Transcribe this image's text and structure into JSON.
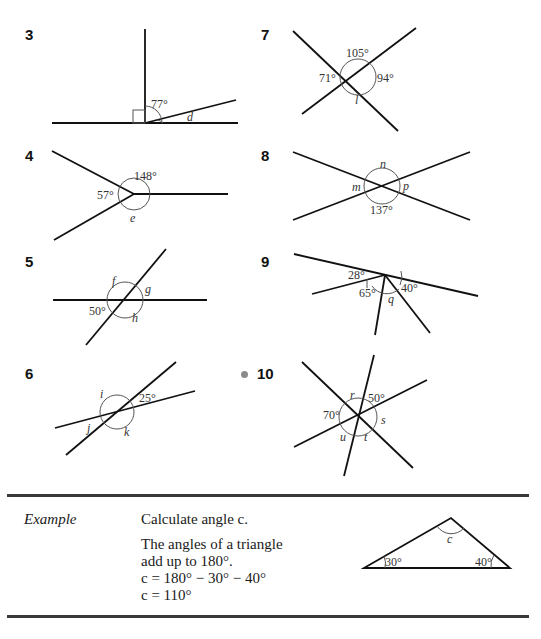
{
  "questions": [
    {
      "number": "3",
      "angles": [
        "77°",
        "d"
      ],
      "notes": "right angle marked"
    },
    {
      "number": "4",
      "angles": [
        "148°",
        "57°",
        "e"
      ]
    },
    {
      "number": "5",
      "angles": [
        "f",
        "g",
        "50°",
        "h"
      ]
    },
    {
      "number": "6",
      "angles": [
        "i",
        "25°",
        "j",
        "k"
      ]
    },
    {
      "number": "7",
      "angles": [
        "105°",
        "71°",
        "94°",
        "l"
      ]
    },
    {
      "number": "8",
      "angles": [
        "n",
        "m",
        "p",
        "137°"
      ]
    },
    {
      "number": "9",
      "angles": [
        "28°",
        "40°",
        "65°",
        "q"
      ]
    },
    {
      "number": "10",
      "angles": [
        "r",
        "50°",
        "70°",
        "s",
        "u",
        "t"
      ],
      "challenge_marker": true
    }
  ],
  "example": {
    "label": "Example",
    "prompt": "Calculate angle c.",
    "line1": "The angles of a triangle",
    "line2": "add up to 180°.",
    "line3": "c = 180° − 30° − 40°",
    "line4": "c = 110°",
    "triangle": {
      "angle_left": "30°",
      "angle_right": "40°",
      "angle_top": "c"
    }
  }
}
